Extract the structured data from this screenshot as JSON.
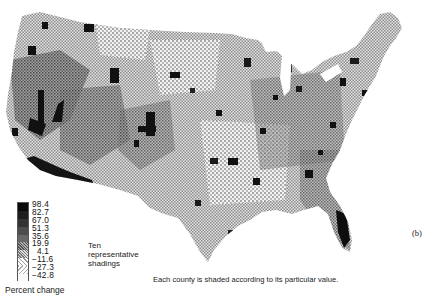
{
  "figure": {
    "panel_label": "(b)",
    "caption": "Each county is shaded according to its particular value."
  },
  "legend": {
    "title": "Percent change",
    "note_lines": [
      "Ten",
      "representative",
      "shadings"
    ],
    "classes": [
      {
        "value": "98.4",
        "shade": "#0a0a0a"
      },
      {
        "value": "82.7",
        "shade": "#1e1e1e"
      },
      {
        "value": "67.0",
        "shade": "#333333"
      },
      {
        "value": "51.3",
        "shade": "#4d4d4d"
      },
      {
        "value": "35.6",
        "shade": "#686868"
      },
      {
        "value": "19.9",
        "shade": "#858585"
      },
      {
        "value": "4.1",
        "shade": "#a3a3a3"
      },
      {
        "value": "−11.6",
        "shade": "#c2c2c2"
      },
      {
        "value": "−27.3",
        "shade": "#dedede"
      },
      {
        "value": "−42.8",
        "shade": "#f7f7f7"
      }
    ]
  },
  "colors": {
    "dark_fill": "#111111",
    "mid_fill": "#7a7a7a",
    "halftone_light": "#bdbdbd",
    "background": "#ffffff"
  }
}
